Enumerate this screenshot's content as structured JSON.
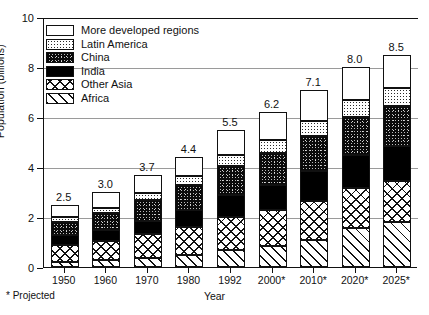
{
  "chart_data": {
    "type": "bar",
    "stacked": true,
    "title": "",
    "subtitle": "",
    "xlabel": "Year",
    "ylabel": "Population (billions)",
    "ylim": [
      0,
      10
    ],
    "yticks": [
      0,
      2,
      4,
      6,
      8,
      10
    ],
    "ytick_labels": [
      "0",
      "2",
      "4",
      "6",
      "8",
      "10"
    ],
    "grid": "horizontal",
    "legend_position": "upper-left inside plot",
    "footnote": "* Projected",
    "categories": [
      "1950",
      "1960",
      "1970",
      "1980",
      "1992",
      "2000*",
      "2010*",
      "2020*",
      "2025*"
    ],
    "totals": [
      2.5,
      3.0,
      3.7,
      4.4,
      5.5,
      6.2,
      7.1,
      8.0,
      8.5
    ],
    "total_labels": [
      "2.5",
      "3.0",
      "3.7",
      "4.4",
      "5.5",
      "6.2",
      "7.1",
      "8.0",
      "8.5"
    ],
    "series": [
      {
        "name": "Africa",
        "key": "africa",
        "pattern": "diagonal-hatch",
        "values": [
          0.22,
          0.28,
          0.36,
          0.48,
          0.68,
          0.85,
          1.1,
          1.55,
          1.8
        ]
      },
      {
        "name": "Other Asia",
        "key": "asia",
        "pattern": "cross-hatch",
        "values": [
          0.68,
          0.78,
          0.95,
          1.12,
          1.32,
          1.45,
          1.55,
          1.62,
          1.65
        ]
      },
      {
        "name": "India",
        "key": "india",
        "pattern": "solid-black",
        "values": [
          0.37,
          0.44,
          0.55,
          0.69,
          0.88,
          1.0,
          1.18,
          1.32,
          1.4
        ]
      },
      {
        "name": "China",
        "key": "china",
        "pattern": "black-speckle",
        "values": [
          0.55,
          0.65,
          0.82,
          0.98,
          1.17,
          1.28,
          1.4,
          1.52,
          1.6
        ]
      },
      {
        "name": "Latin America",
        "key": "latin",
        "pattern": "stipple",
        "values": [
          0.17,
          0.21,
          0.28,
          0.36,
          0.45,
          0.52,
          0.6,
          0.68,
          0.72
        ]
      },
      {
        "name": "More developed regions",
        "key": "more",
        "pattern": "white",
        "values": [
          0.51,
          0.64,
          0.74,
          0.77,
          1.0,
          1.1,
          1.27,
          1.31,
          1.33
        ]
      }
    ],
    "legend_entries": [
      {
        "label": "More developed regions",
        "pattern": "white"
      },
      {
        "label": "Latin America",
        "pattern": "stipple"
      },
      {
        "label": "China",
        "pattern": "black-speckle"
      },
      {
        "label": "India",
        "pattern": "solid-black"
      },
      {
        "label": "Other Asia",
        "pattern": "cross-hatch"
      },
      {
        "label": "Africa",
        "pattern": "diagonal-hatch"
      }
    ]
  }
}
